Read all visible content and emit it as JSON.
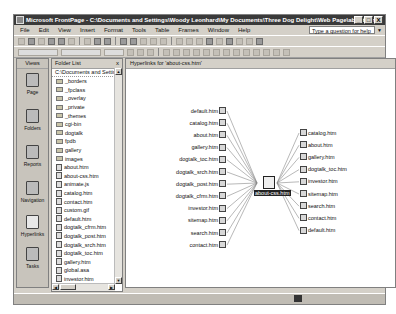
{
  "window": {
    "title": "Microsoft FrontPage - C:\\Documents and Settings\\Woody Leonhard\\My Documents\\Three Dog Delight\\Web Page\\about.htm",
    "controls": [
      "_",
      "□",
      "X"
    ]
  },
  "menubar": {
    "items": [
      "File",
      "Edit",
      "View",
      "Insert",
      "Format",
      "Tools",
      "Table",
      "Frames",
      "Window",
      "Help"
    ],
    "help_placeholder": "Type a question for help"
  },
  "views": {
    "title": "Views",
    "items": [
      {
        "label": "Page",
        "icon": "page-view-icon"
      },
      {
        "label": "Folders",
        "icon": "folders-view-icon"
      },
      {
        "label": "Reports",
        "icon": "reports-view-icon"
      },
      {
        "label": "Navigation",
        "icon": "navigation-view-icon"
      },
      {
        "label": "Hyperlinks",
        "icon": "hyperlinks-view-icon",
        "active": true
      },
      {
        "label": "Tasks",
        "icon": "tasks-view-icon"
      }
    ]
  },
  "folder_list": {
    "title": "Folder List",
    "close": "x",
    "root": "C:\\Documents and Settin",
    "items": [
      {
        "name": "_borders",
        "type": "folder"
      },
      {
        "name": "_fpclass",
        "type": "folder"
      },
      {
        "name": "_overlay",
        "type": "folder"
      },
      {
        "name": "_private",
        "type": "folder"
      },
      {
        "name": "_themes",
        "type": "folder"
      },
      {
        "name": "cgi-bin",
        "type": "folder"
      },
      {
        "name": "dogtalk",
        "type": "folder"
      },
      {
        "name": "fpdb",
        "type": "folder"
      },
      {
        "name": "gallery",
        "type": "folder"
      },
      {
        "name": "images",
        "type": "folder"
      },
      {
        "name": "about.htm",
        "type": "page"
      },
      {
        "name": "about-css.htm",
        "type": "page"
      },
      {
        "name": "animate.js",
        "type": "page"
      },
      {
        "name": "catalog.htm",
        "type": "page"
      },
      {
        "name": "contact.htm",
        "type": "page"
      },
      {
        "name": "custom.gif",
        "type": "page"
      },
      {
        "name": "default.htm",
        "type": "page"
      },
      {
        "name": "dogtalk_cfrm.htm",
        "type": "page"
      },
      {
        "name": "dogtalk_post.htm",
        "type": "page"
      },
      {
        "name": "dogtalk_srch.htm",
        "type": "page"
      },
      {
        "name": "dogtalk_toc.htm",
        "type": "page"
      },
      {
        "name": "gallery.htm",
        "type": "page"
      },
      {
        "name": "global.asa",
        "type": "page"
      },
      {
        "name": "investor.htm",
        "type": "page"
      }
    ]
  },
  "hyperlinks": {
    "title": "Hyperlinks for 'about-css.htm'",
    "center": "about-css.htm",
    "incoming": [
      "default.htm",
      "catalog.htm",
      "about.htm",
      "gallery.htm",
      "dogtalk_toc.htm",
      "dogtalk_srch.htm",
      "dogtalk_post.htm",
      "dogtalk_cfrm.htm",
      "investor.htm",
      "sitemap.htm",
      "search.htm",
      "contact.htm"
    ],
    "outgoing": [
      "catalog.htm",
      "about.htm",
      "gallery.htm",
      "dogtalk_toc.htm",
      "investor.htm",
      "sitemap.htm",
      "search.htm",
      "contact.htm",
      "default.htm"
    ]
  }
}
